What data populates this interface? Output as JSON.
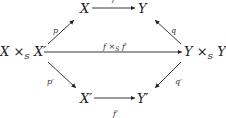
{
  "diagram": {
    "type": "commutative-diagram",
    "nodes": {
      "X": "X",
      "Y": "Y",
      "XxSX_left": "X ×",
      "XxSX_sub": "S",
      "XxSX_right": " X′",
      "YxSY_left": "Y ×",
      "YxSY_sub": "S",
      "YxSY_right": " Y′",
      "Xp": "X′",
      "Yp": "Y′"
    },
    "arrows": {
      "f": "f",
      "p": "p",
      "q": "q",
      "fxf_left": "f ×",
      "fxf_sub": "S",
      "fxf_right": " f′",
      "p_prime": "p′",
      "q_prime": "q′",
      "f_prime": "f′"
    },
    "edges": [
      {
        "from": "X",
        "to": "Y",
        "label": "f"
      },
      {
        "from": "X ×_S X′",
        "to": "X",
        "label": "p"
      },
      {
        "from": "Y ×_S Y′",
        "to": "Y",
        "label": "q"
      },
      {
        "from": "X ×_S X′",
        "to": "Y ×_S Y′",
        "label": "f ×_S f′"
      },
      {
        "from": "X ×_S X′",
        "to": "X′",
        "label": "p′"
      },
      {
        "from": "Y ×_S Y′",
        "to": "Y′",
        "label": "q′"
      },
      {
        "from": "X′",
        "to": "Y′",
        "label": "f′"
      }
    ]
  }
}
